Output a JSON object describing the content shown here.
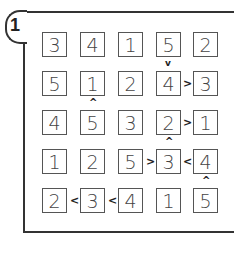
{
  "puzzle": {
    "number": "1",
    "type": "futoshiki",
    "size": 5,
    "grid": [
      [
        "3",
        "4",
        "1",
        "5",
        "2"
      ],
      [
        "5",
        "1",
        "2",
        "4",
        "3"
      ],
      [
        "4",
        "5",
        "3",
        "2",
        "1"
      ],
      [
        "1",
        "2",
        "5",
        "3",
        "4"
      ],
      [
        "2",
        "3",
        "4",
        "1",
        "5"
      ]
    ],
    "horizontal_constraints": [
      {
        "row": 1,
        "between": [
          3,
          4
        ],
        "symbol": ">"
      },
      {
        "row": 2,
        "between": [
          3,
          4
        ],
        "symbol": ">"
      },
      {
        "row": 3,
        "between": [
          2,
          3
        ],
        "symbol": ">"
      },
      {
        "row": 3,
        "between": [
          3,
          4
        ],
        "symbol": "<"
      },
      {
        "row": 4,
        "between": [
          0,
          1
        ],
        "symbol": "<"
      },
      {
        "row": 4,
        "between": [
          1,
          2
        ],
        "symbol": "<"
      }
    ],
    "vertical_constraints": [
      {
        "col": 3,
        "between": [
          0,
          1
        ],
        "symbol": "v"
      },
      {
        "col": 1,
        "between": [
          1,
          2
        ],
        "symbol": "^"
      },
      {
        "col": 3,
        "between": [
          2,
          3
        ],
        "symbol": "^"
      },
      {
        "col": 4,
        "between": [
          3,
          4
        ],
        "symbol": "^"
      }
    ]
  },
  "labels": {
    "r0c0": "3",
    "r0c1": "4",
    "r0c2": "1",
    "r0c3": "5",
    "r0c4": "2",
    "r1c0": "5",
    "r1c1": "1",
    "r1c2": "2",
    "r1c3": "4",
    "r1c4": "3",
    "r2c0": "4",
    "r2c1": "5",
    "r2c2": "3",
    "r2c3": "2",
    "r2c4": "1",
    "r3c0": "1",
    "r3c1": "2",
    "r3c2": "5",
    "r3c3": "3",
    "r3c4": "4",
    "r4c0": "2",
    "r4c1": "3",
    "r4c2": "4",
    "r4c3": "1",
    "r4c4": "5",
    "gt": ">",
    "lt": "<",
    "up": "^",
    "down": "v"
  }
}
